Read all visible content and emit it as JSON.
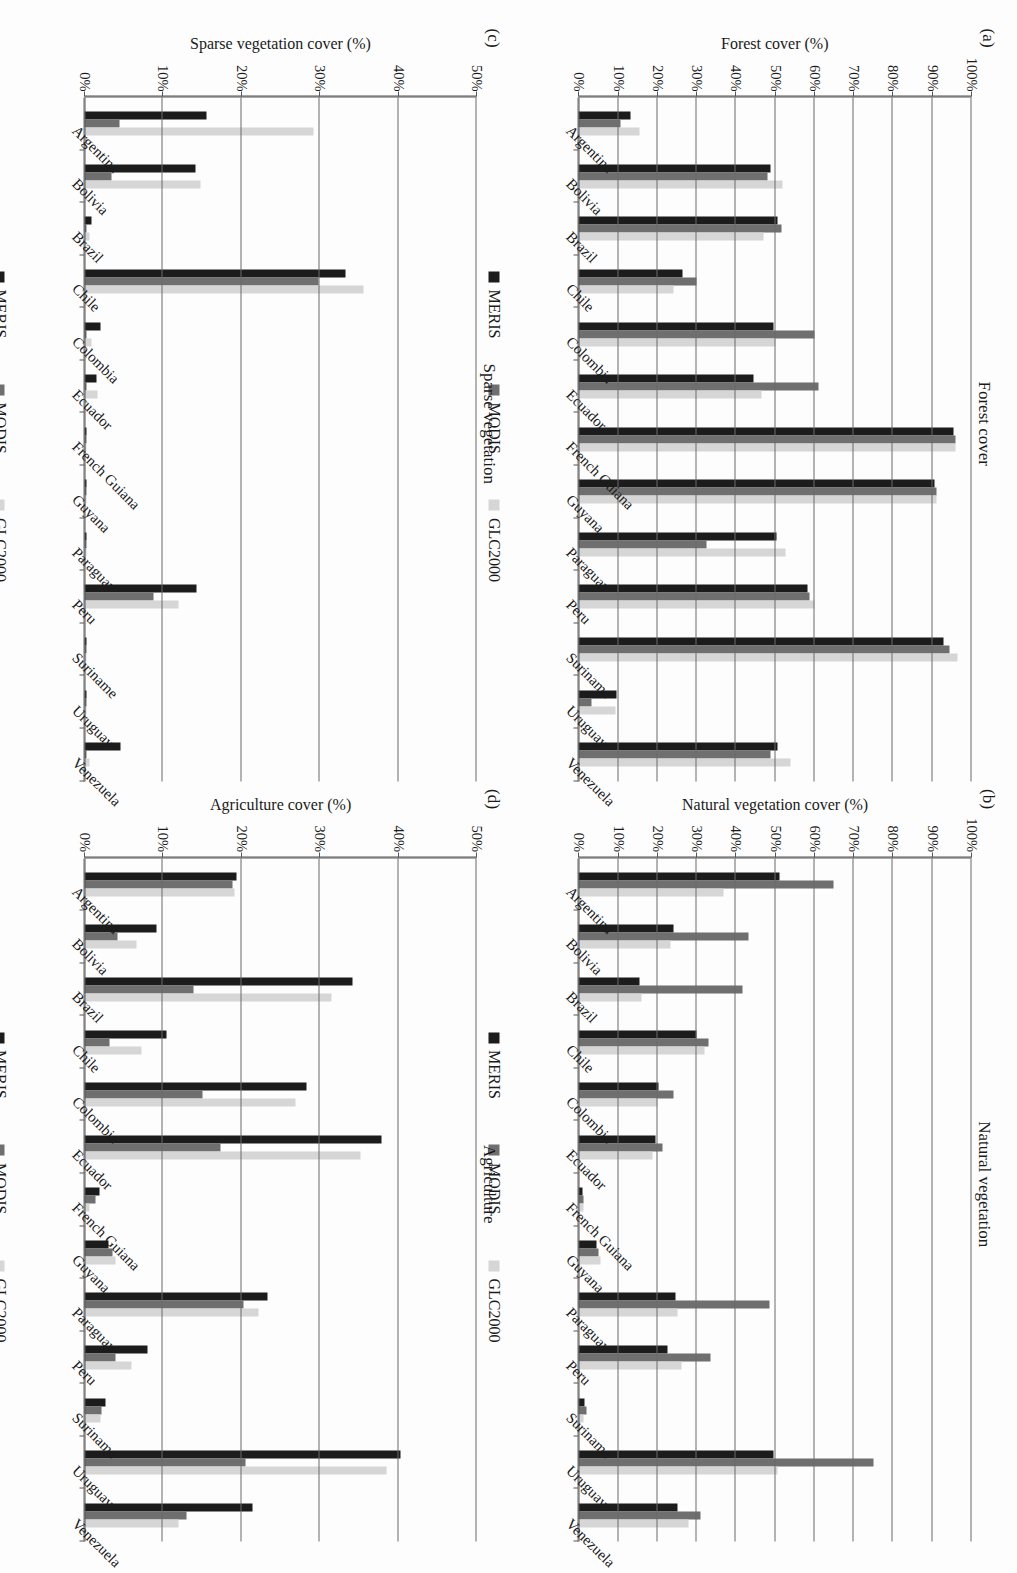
{
  "figure": {
    "series_colors": {
      "MERIS": "#1c1c1c",
      "MODIS": "#6f6f6f",
      "GLC2000": "#d6d6d6"
    },
    "legend": [
      "MERIS",
      "MODIS",
      "GLC2000"
    ],
    "categories": [
      "Argentina",
      "Bolivia",
      "Brazil",
      "Chile",
      "Colombia",
      "Ecuador",
      "French Guiana",
      "Guyana",
      "Paraguay",
      "Peru",
      "Suriname",
      "Uruguay",
      "Venezuela"
    ]
  },
  "panels": {
    "a": {
      "tag": "(a)",
      "title": "Forest cover",
      "ylabel": "Forest cover (%)"
    },
    "b": {
      "tag": "(b)",
      "title": "Natural vegetation",
      "ylabel": "Natural vegetation cover (%)"
    },
    "c": {
      "tag": "(c)",
      "title": "Sparse vegetation",
      "ylabel": "Sparse vegetation cover (%)"
    },
    "d": {
      "tag": "(d)",
      "title": "Agriculture",
      "ylabel": "Agriculture cover (%)"
    }
  },
  "chart_data": [
    {
      "id": "a",
      "type": "bar",
      "title": "Forest cover",
      "xlabel": "",
      "ylabel": "Forest cover (%)",
      "ylim": [
        0,
        100
      ],
      "yticks": [
        "0%",
        "10%",
        "20%",
        "30%",
        "40%",
        "50%",
        "60%",
        "70%",
        "80%",
        "90%",
        "100%"
      ],
      "grid": true,
      "legend": [
        "MERIS",
        "MODIS",
        "GLC2000"
      ],
      "legend_position": "bottom",
      "categories": [
        "Argentina",
        "Bolivia",
        "Brazil",
        "Chile",
        "Colombia",
        "Ecuador",
        "French Guiana",
        "Guyana",
        "Paraguay",
        "Peru",
        "Suriname",
        "Uruguay",
        "Venezuela"
      ],
      "series": [
        {
          "name": "MERIS",
          "values": [
            13.2,
            48.8,
            50.5,
            26.5,
            49.5,
            44.5,
            95.5,
            90.5,
            50.2,
            58.3,
            92.9,
            9.5,
            50.6
          ]
        },
        {
          "name": "MODIS",
          "values": [
            10.5,
            48.0,
            51.5,
            30.0,
            60.0,
            61.0,
            96.0,
            91.0,
            32.5,
            58.7,
            94.3,
            3.3,
            48.9
          ]
        },
        {
          "name": "GLC2000",
          "values": [
            15.5,
            51.8,
            47.0,
            24.0,
            50.0,
            46.5,
            96.0,
            91.0,
            52.7,
            59.9,
            96.4,
            9.3,
            53.9
          ]
        }
      ]
    },
    {
      "id": "b",
      "type": "bar",
      "title": "Natural vegetation",
      "xlabel": "",
      "ylabel": "Natural vegetation cover (%)",
      "ylim": [
        0,
        100
      ],
      "yticks": [
        "0%",
        "10%",
        "20%",
        "30%",
        "40%",
        "50%",
        "60%",
        "70%",
        "80%",
        "90%",
        "100%"
      ],
      "grid": true,
      "legend": [
        "MERIS",
        "MODIS",
        "GLC2000"
      ],
      "legend_position": "bottom",
      "categories": [
        "Argentina",
        "Bolivia",
        "Brazil",
        "Chile",
        "Colombia",
        "Ecuador",
        "French Guiana",
        "Guyana",
        "Paraguay",
        "Peru",
        "Suriname",
        "Uruguay",
        "Venezuela"
      ],
      "series": [
        {
          "name": "MERIS",
          "values": [
            51.0,
            24.0,
            15.5,
            30.0,
            20.2,
            19.6,
            1.0,
            4.5,
            24.5,
            22.5,
            1.5,
            49.5,
            25.0
          ]
        },
        {
          "name": "MODIS",
          "values": [
            64.9,
            43.1,
            41.7,
            33.0,
            24.0,
            21.4,
            1.2,
            5.0,
            48.5,
            33.5,
            2.0,
            75.0,
            31.0
          ]
        },
        {
          "name": "GLC2000",
          "values": [
            36.7,
            23.2,
            16.0,
            31.9,
            20.0,
            18.8,
            1.2,
            5.5,
            25.0,
            26.0,
            1.2,
            50.5,
            28.0
          ]
        }
      ]
    },
    {
      "id": "c",
      "type": "bar",
      "title": "Sparse vegetation",
      "xlabel": "",
      "ylabel": "Sparse vegetation cover (%)",
      "ylim": [
        0,
        50
      ],
      "yticks": [
        "0%",
        "10%",
        "20%",
        "30%",
        "40%",
        "50%"
      ],
      "grid": true,
      "legend": [
        "MERIS",
        "MODIS",
        "GLC2000"
      ],
      "legend_position": "bottom",
      "categories": [
        "Argentina",
        "Bolivia",
        "Brazil",
        "Chile",
        "Colombia",
        "Ecuador",
        "French Guiana",
        "Guyana",
        "Paraguay",
        "Peru",
        "Suriname",
        "Uruguay",
        "Venezuela"
      ],
      "series": [
        {
          "name": "MERIS",
          "values": [
            15.5,
            14.1,
            0.9,
            33.3,
            2.0,
            1.5,
            0.1,
            0.3,
            0.1,
            14.3,
            0.1,
            0.1,
            4.6
          ]
        },
        {
          "name": "MODIS",
          "values": [
            4.5,
            3.5,
            0.3,
            29.8,
            0.2,
            0.2,
            0.1,
            0.1,
            0.1,
            8.8,
            0.1,
            0.1,
            0.2
          ]
        },
        {
          "name": "GLC2000",
          "values": [
            29.2,
            14.8,
            0.7,
            35.5,
            0.9,
            1.7,
            0.2,
            0.2,
            0.1,
            12.0,
            0.1,
            0.1,
            0.6
          ]
        }
      ]
    },
    {
      "id": "d",
      "type": "bar",
      "title": "Agriculture",
      "xlabel": "",
      "ylabel": "Agriculture cover (%)",
      "ylim": [
        0,
        50
      ],
      "yticks": [
        "0%",
        "10%",
        "20%",
        "30%",
        "40%",
        "50%"
      ],
      "grid": true,
      "legend": [
        "MERIS",
        "MODIS",
        "GLC2000"
      ],
      "legend_position": "bottom",
      "categories": [
        "Argentina",
        "Bolivia",
        "Brazil",
        "Chile",
        "Colombia",
        "Ecuador",
        "French Guiana",
        "Guyana",
        "Paraguay",
        "Peru",
        "Suriname",
        "Uruguay",
        "Venezuela"
      ],
      "series": [
        {
          "name": "MERIS",
          "values": [
            19.4,
            9.2,
            34.1,
            10.4,
            28.3,
            37.9,
            1.9,
            3.0,
            23.3,
            8.0,
            2.7,
            40.2,
            21.4
          ]
        },
        {
          "name": "MODIS",
          "values": [
            18.8,
            4.2,
            13.9,
            3.2,
            15.0,
            17.3,
            1.4,
            3.6,
            20.3,
            4.0,
            2.2,
            20.5,
            13.0
          ]
        },
        {
          "name": "GLC2000",
          "values": [
            19.1,
            6.6,
            31.5,
            7.2,
            26.9,
            35.1,
            0.7,
            4.0,
            22.2,
            6.0,
            2.0,
            38.5,
            12.0
          ]
        }
      ]
    }
  ]
}
